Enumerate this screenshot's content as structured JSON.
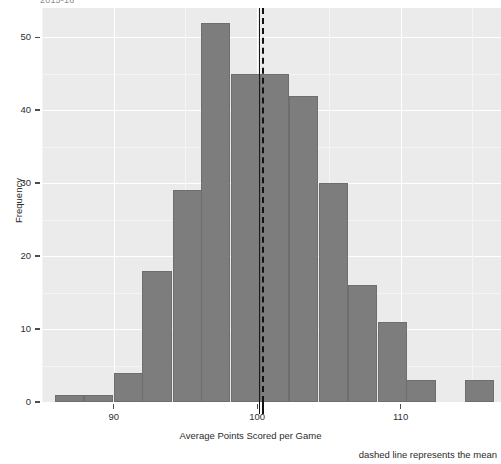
{
  "figure": {
    "top_clipped_caption": "2015-16",
    "background": "#ffffff",
    "panel_background": "#ebebeb",
    "grid_color": "#ffffff",
    "bar_fill": "#7d7d7d",
    "bar_stroke": "#6e6e6e",
    "mean_line_color": "#111111"
  },
  "chart_data": {
    "type": "bar",
    "title": "",
    "subtitle": "",
    "xlabel": "Average Points Scored per Game",
    "ylabel": "Frequency",
    "annotation": "dashed line represents the mean",
    "grid": true,
    "legend": "none",
    "xlim": [
      85.0,
      117.0
    ],
    "ylim": [
      0,
      54
    ],
    "xticks": [
      90,
      100,
      110
    ],
    "xtick_labels": [
      "90",
      "100",
      "110"
    ],
    "yticks": [
      0,
      10,
      20,
      30,
      40,
      50
    ],
    "ytick_labels": [
      "0",
      "10",
      "20",
      "30",
      "40",
      "50"
    ],
    "bin_width": 2.04,
    "bin_starts": [
      85.9,
      87.9,
      90.0,
      92.0,
      94.1,
      96.1,
      98.2,
      100.2,
      102.2,
      104.3,
      106.3,
      108.4,
      110.4,
      112.5,
      114.5
    ],
    "categories": [
      "85.9-87.9",
      "87.9-90.0",
      "90.0-92.0",
      "92.0-94.1",
      "94.1-96.1",
      "96.1-98.2",
      "98.2-100.2",
      "100.2-102.2",
      "102.2-104.3",
      "104.3-106.3",
      "106.3-108.4",
      "108.4-110.4",
      "110.4-112.5",
      "112.5-114.5",
      "114.5-116.6"
    ],
    "values": [
      1,
      1,
      4,
      18,
      29,
      52,
      45,
      45,
      42,
      30,
      16,
      11,
      3,
      0,
      3
    ],
    "mean_value": 100.2,
    "mean_line_style": "dashed"
  }
}
